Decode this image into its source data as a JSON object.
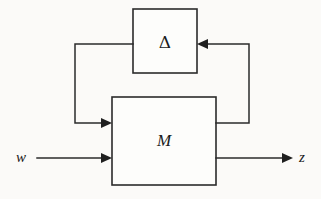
{
  "figure": {
    "kind": "block-diagram",
    "background_color": "#fbfaf8",
    "line_color": "#2b2b2b",
    "text_color": "#1b1b1b"
  },
  "blocks": {
    "delta": {
      "label": "Δ",
      "name": "delta-block",
      "x": 133,
      "y": 9,
      "width": 64,
      "height": 64,
      "label_x": 165,
      "label_y": 42,
      "font_size": 17
    },
    "m": {
      "label": "M",
      "name": "m-block",
      "x": 112,
      "y": 97,
      "width": 104,
      "height": 88,
      "label_x": 164,
      "label_y": 141,
      "font_size": 17
    }
  },
  "signals": {
    "w": {
      "label": "w",
      "label_x": 21,
      "label_y": 158,
      "font_size": 15
    },
    "z": {
      "label": "z",
      "label_x": 302,
      "label_y": 158,
      "font_size": 15
    }
  },
  "wires": {
    "input_w": {
      "name": "w-input-wire",
      "path": "M 37 158 L 107 158",
      "arrow_at": [
        112,
        158
      ],
      "arrow_dir": "right"
    },
    "output_z": {
      "name": "z-output-wire",
      "path": "M 216 158 L 286 158",
      "arrow_at": [
        293,
        158
      ],
      "arrow_dir": "right"
    },
    "delta_to_m": {
      "name": "delta-output-feedback-wire",
      "path": "M 133 44 L 75 44 L 75 123 L 107 123",
      "arrow_at": [
        112,
        123
      ],
      "arrow_dir": "right"
    },
    "m_to_delta": {
      "name": "m-output-feedback-wire",
      "path": "M 216 123 L 249 123 L 249 44 L 203 44",
      "arrow_at": [
        197,
        44
      ],
      "arrow_dir": "left"
    }
  }
}
